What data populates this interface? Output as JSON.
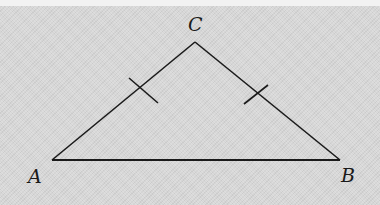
{
  "diagram": {
    "type": "isosceles-triangle",
    "background_color": "#d6d6d6",
    "stroke_color": "#1a1a1a",
    "vertices": {
      "A": {
        "label": "A",
        "x": 52,
        "y": 160
      },
      "B": {
        "label": "B",
        "x": 340,
        "y": 160
      },
      "C": {
        "label": "C",
        "x": 195,
        "y": 42
      }
    },
    "labels": {
      "A": "A",
      "B": "B",
      "C": "C"
    },
    "segments": [
      {
        "name": "AB",
        "from": "A",
        "to": "B"
      },
      {
        "name": "AC",
        "from": "A",
        "to": "C",
        "tick_marks": 1
      },
      {
        "name": "CB",
        "from": "C",
        "to": "B",
        "tick_marks": 1
      }
    ],
    "congruent_sides": [
      "AC",
      "CB"
    ]
  }
}
